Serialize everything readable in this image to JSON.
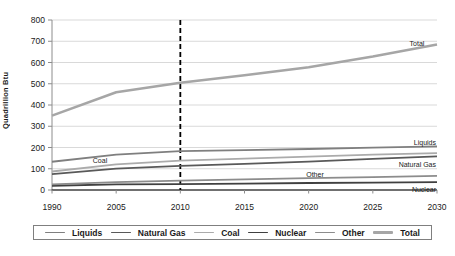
{
  "chart_data": {
    "type": "line",
    "title": "",
    "xlabel": "",
    "ylabel": "Quadrillion Btu",
    "categories": [
      "1990",
      "2005",
      "2010",
      "2015",
      "2020",
      "2025",
      "2030"
    ],
    "y_ticks": [
      0,
      100,
      200,
      300,
      400,
      500,
      600,
      700,
      800
    ],
    "ylim": [
      0,
      800
    ],
    "grid": true,
    "legend_position": "bottom",
    "reference_line": {
      "at_category": "2010",
      "style": "dashed",
      "color": "#000000"
    },
    "series": [
      {
        "name": "Liquids",
        "color": "#7f7f7f",
        "width": 1.8,
        "values": [
          133,
          166,
          183,
          188,
          193,
          199,
          205
        ]
      },
      {
        "name": "Natural Gas",
        "color": "#595959",
        "width": 1.8,
        "values": [
          75,
          101,
          114,
          123,
          134,
          146,
          158
        ]
      },
      {
        "name": "Coal",
        "color": "#ababab",
        "width": 1.8,
        "values": [
          87,
          121,
          138,
          148,
          157,
          166,
          174
        ]
      },
      {
        "name": "Nuclear",
        "color": "#404040",
        "width": 1.8,
        "values": [
          20,
          26,
          28,
          30,
          33,
          35,
          37
        ]
      },
      {
        "name": "Other",
        "color": "#8c8c8c",
        "width": 1.8,
        "values": [
          26,
          37,
          44,
          50,
          56,
          61,
          66
        ]
      },
      {
        "name": "Total",
        "color": "#a6a6a6",
        "width": 2.6,
        "values": [
          350,
          460,
          505,
          540,
          578,
          628,
          685
        ]
      }
    ],
    "inline_series_labels": [
      "Total",
      "Liquids",
      "Natural Gas",
      "Coal",
      "Other",
      "Nuclear"
    ],
    "axis_colors": {
      "gridline": "#d9d9d9",
      "y_axis": "#8c8c8c",
      "x_axis": "#404040",
      "tick_text": "#1a1a1a"
    }
  }
}
